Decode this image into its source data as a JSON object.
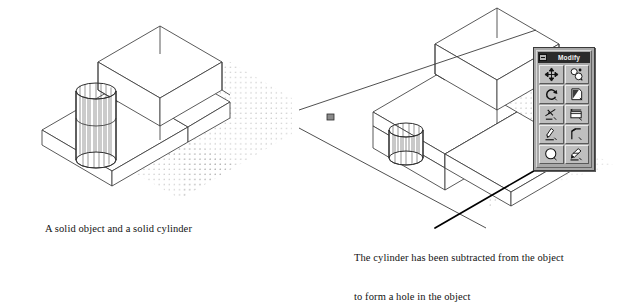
{
  "document": {
    "background_color": "#ffffff",
    "figure_type": "two-panel CAD illustration"
  },
  "panels": [
    {
      "id": "before",
      "caption": "A solid object and a solid cylinder",
      "scene": {
        "description": "Isometric wireframe L-shaped solid block with a tall solid cylinder passing through the base slab, drawn over a dotted ground grid",
        "objects": [
          "l-shaped-solid",
          "tall-cylinder",
          "dotted-ground-grid"
        ],
        "line_color": "#3a3a3a",
        "grid_dot_color": "#9a9a9a"
      }
    },
    {
      "id": "after",
      "caption_line_1": "The cylinder has been subtracted from the object",
      "caption_line_2": "to form a hole in the object",
      "scene": {
        "description": "Same isometric L-shaped solid, now with a cylindrical hole in the base slab; AutoCAD full-screen crosshair cursor at left and a leader line from the Subtract toolbar button",
        "objects": [
          "l-shaped-solid",
          "cylindrical-hole",
          "dotted-ground-grid",
          "crosshair-cursor",
          "leader-line"
        ],
        "line_color": "#3a3a3a",
        "grid_dot_color": "#9a9a9a",
        "leader_color": "#000000"
      }
    }
  ],
  "toolbar": {
    "title": "Modify",
    "title_bar_color": "#2b2b2b",
    "face_color": "#a8a8a8",
    "button_color": "#bfbfbf",
    "system_box_label": "close-box",
    "columns": 2,
    "rows": 5,
    "buttons": [
      {
        "name": "move",
        "icon": "four-way-arrow-icon",
        "tooltip": "Move"
      },
      {
        "name": "copy",
        "icon": "copy-objects-icon",
        "tooltip": "Copy Object"
      },
      {
        "name": "rotate",
        "icon": "rotate-arrow-icon",
        "tooltip": "Rotate"
      },
      {
        "name": "mirror",
        "icon": "mirror-page-icon",
        "tooltip": "Mirror"
      },
      {
        "name": "trim",
        "icon": "trim-scissor-icon",
        "tooltip": "Trim"
      },
      {
        "name": "stretch",
        "icon": "stretch-box-icon",
        "tooltip": "Stretch"
      },
      {
        "name": "erase",
        "icon": "erase-pencil-icon",
        "tooltip": "Erase"
      },
      {
        "name": "chamfer",
        "icon": "chamfer-corner-icon",
        "tooltip": "Chamfer"
      },
      {
        "name": "subtract",
        "icon": "boolean-subtract-icon",
        "tooltip": "Subtract"
      },
      {
        "name": "explode",
        "icon": "explode-brush-icon",
        "tooltip": "Explode"
      }
    ]
  }
}
